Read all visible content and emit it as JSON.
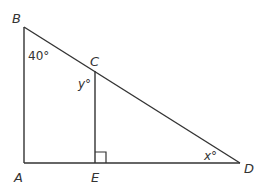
{
  "diagram": {
    "type": "geometry-triangle",
    "points": {
      "A": {
        "label": "A",
        "x": 24,
        "y": 163
      },
      "B": {
        "label": "B",
        "x": 24,
        "y": 27
      },
      "C": {
        "label": "C",
        "x": 95,
        "y": 71
      },
      "D": {
        "label": "D",
        "x": 240,
        "y": 163
      },
      "E": {
        "label": "E",
        "x": 95,
        "y": 163
      }
    },
    "segments": [
      "AB",
      "BD",
      "AD",
      "CE"
    ],
    "angles": {
      "B": "40°",
      "C": "y°",
      "D": "x°"
    },
    "right_angle_marker": "E",
    "stroke_color": "#333333"
  }
}
